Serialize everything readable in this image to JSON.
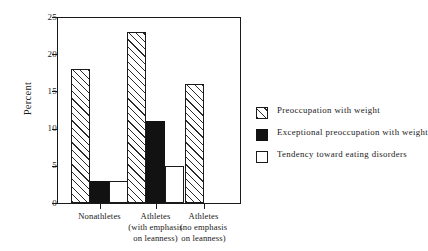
{
  "chart_data": {
    "type": "bar",
    "title": "",
    "subtitle": "",
    "xlabel": "",
    "ylabel": "Percent",
    "ylim": [
      0,
      25
    ],
    "yticks": [
      0,
      5,
      10,
      15,
      20,
      25
    ],
    "ytick_labels": [
      "0",
      "5",
      "10",
      "15",
      "20",
      "25"
    ],
    "grid": false,
    "legend_position": "right",
    "categories": [
      "Nonathletes",
      "Athletes (with emphasis on leanness)",
      "Athletes (no emphasis on leanness)"
    ],
    "category_lines": [
      [
        "Nonathletes"
      ],
      [
        "Athletes",
        "(with emphasis",
        "on leanness)"
      ],
      [
        "Athletes",
        "(no emphasis",
        "on leanness)"
      ]
    ],
    "series": [
      {
        "name": "Preoccupation with weight",
        "fill": "hatched",
        "values": [
          18,
          23,
          16
        ]
      },
      {
        "name": "Exceptional preoccupation with weight",
        "fill": "solid",
        "values": [
          3,
          11,
          0
        ]
      },
      {
        "name": "Tendency toward eating disorders",
        "fill": "open",
        "values": [
          3,
          5,
          0
        ]
      }
    ]
  },
  "axis": {
    "y_label": "Percent",
    "y_tick_0": "0",
    "y_tick_1": "5",
    "y_tick_2": "10",
    "y_tick_3": "15",
    "y_tick_4": "20",
    "y_tick_5": "25"
  },
  "groups": [
    {
      "line1": "Nonathletes",
      "line2": "",
      "line3": ""
    },
    {
      "line1": "Athletes",
      "line2": "(with emphasis",
      "line3": "on leanness)"
    },
    {
      "line1": "Athletes",
      "line2": "(no emphasis",
      "line3": "on leanness)"
    }
  ],
  "legend": {
    "items": [
      {
        "label": "Preoccupation with weight",
        "fill": "hatched"
      },
      {
        "label": "Exceptional preoccupation with weight",
        "fill": "solid"
      },
      {
        "label": "Tendency toward eating disorders",
        "fill": "open"
      }
    ]
  },
  "colors": {
    "ink": "#1a1a1a",
    "bar_solid": "#121212",
    "bar_open": "#ffffff",
    "background": "#ffffff"
  }
}
